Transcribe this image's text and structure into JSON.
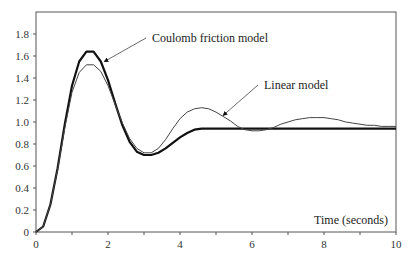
{
  "chart_data": {
    "type": "line",
    "title": "",
    "xlabel": "Time (seconds)",
    "ylabel": "",
    "xlim": [
      0,
      10
    ],
    "ylim": [
      0,
      1.9
    ],
    "xticks": [
      0,
      2,
      4,
      6,
      8,
      10
    ],
    "yticks": [
      0,
      0.2,
      0.4,
      0.6,
      0.8,
      1.0,
      1.2,
      1.4,
      1.6,
      1.8
    ],
    "ytick_labels": [
      "0",
      "0.2",
      "0.4",
      "0.6",
      "0.8",
      "1.0",
      "1.2",
      "1.4",
      "1.6",
      "1.8"
    ],
    "grid": false,
    "legend": "annotations",
    "series": [
      {
        "name": "Coulomb friction model",
        "style": "thick",
        "x": [
          0,
          0.2,
          0.4,
          0.6,
          0.8,
          1.0,
          1.2,
          1.4,
          1.6,
          1.8,
          2.0,
          2.2,
          2.4,
          2.6,
          2.8,
          3.0,
          3.2,
          3.4,
          3.6,
          3.8,
          4.0,
          4.2,
          4.4,
          4.6,
          5.0,
          6.0,
          7.0,
          8.0,
          9.0,
          10.0
        ],
        "values": [
          0,
          0.05,
          0.25,
          0.58,
          0.98,
          1.33,
          1.55,
          1.64,
          1.64,
          1.55,
          1.38,
          1.17,
          0.97,
          0.82,
          0.73,
          0.7,
          0.7,
          0.72,
          0.76,
          0.81,
          0.86,
          0.9,
          0.93,
          0.94,
          0.94,
          0.94,
          0.94,
          0.94,
          0.94,
          0.94
        ]
      },
      {
        "name": "Linear model",
        "style": "thin",
        "x": [
          0,
          0.2,
          0.4,
          0.6,
          0.8,
          1.0,
          1.2,
          1.4,
          1.6,
          1.8,
          2.0,
          2.2,
          2.4,
          2.6,
          2.8,
          3.0,
          3.2,
          3.4,
          3.6,
          3.8,
          4.0,
          4.2,
          4.4,
          4.6,
          4.8,
          5.0,
          5.2,
          5.4,
          5.6,
          5.8,
          6.0,
          6.2,
          6.4,
          6.6,
          6.8,
          7.0,
          7.2,
          7.4,
          7.6,
          7.8,
          8.0,
          8.2,
          8.4,
          8.6,
          8.8,
          9.0,
          9.2,
          9.4,
          9.6,
          9.8,
          10.0
        ],
        "values": [
          0,
          0.05,
          0.25,
          0.57,
          0.95,
          1.27,
          1.45,
          1.52,
          1.52,
          1.46,
          1.33,
          1.16,
          0.99,
          0.85,
          0.76,
          0.72,
          0.72,
          0.76,
          0.84,
          0.94,
          1.03,
          1.09,
          1.12,
          1.13,
          1.12,
          1.09,
          1.05,
          1.01,
          0.96,
          0.93,
          0.92,
          0.92,
          0.93,
          0.95,
          0.98,
          1.0,
          1.02,
          1.03,
          1.04,
          1.04,
          1.04,
          1.03,
          1.02,
          1.0,
          0.99,
          0.98,
          0.97,
          0.97,
          0.96,
          0.96,
          0.96
        ]
      }
    ],
    "annotations": [
      {
        "text": "Coulomb friction model",
        "points_to": [
          1.9,
          1.55
        ]
      },
      {
        "text": "Linear model",
        "points_to": [
          5.2,
          1.06
        ]
      }
    ]
  }
}
